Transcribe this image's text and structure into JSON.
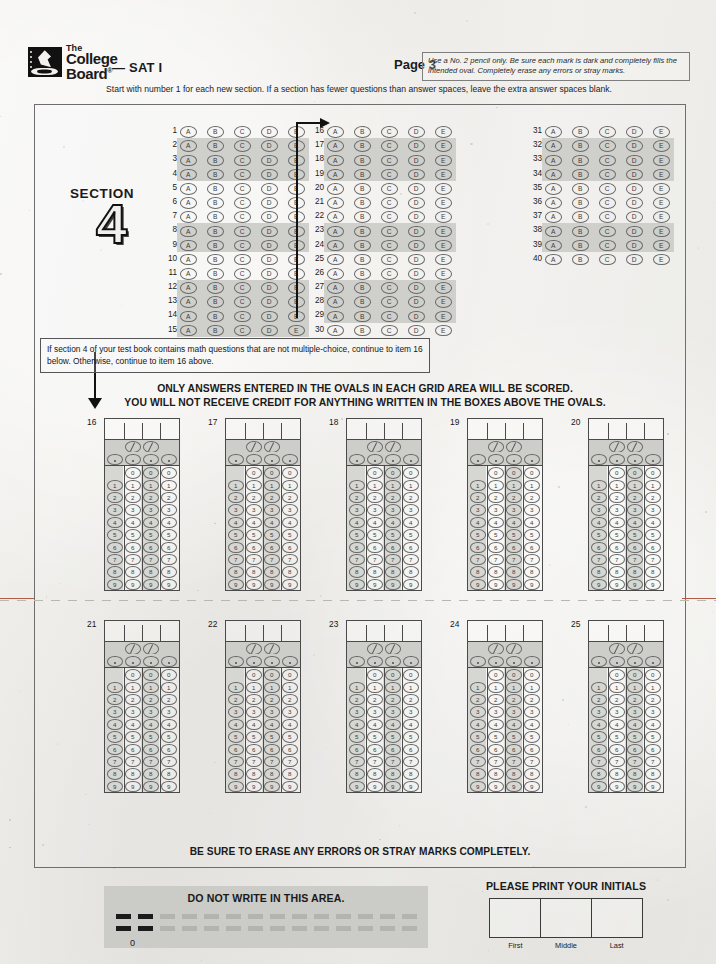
{
  "header": {
    "logo_line1": "The",
    "logo_line2": "College",
    "logo_line3": "Board",
    "logo_sup": "®",
    "brand_suffix": "— SAT I",
    "page_label": "Page 3",
    "pencil_note": "Use a No. 2 pencil only.  Be sure each mark is dark and completely fills the intended oval.  Completely erase any errors or stray marks."
  },
  "start_line": "Start with number 1 for each new section.  If a section has fewer questions than answer spaces, leave the extra answer spaces blank.",
  "section": {
    "label": "SECTION",
    "number": "4",
    "choices": [
      "A",
      "B",
      "C",
      "D",
      "E"
    ],
    "columns": [
      {
        "start": 1,
        "end": 15,
        "shaded_rows": [
          2,
          3,
          4,
          8,
          9,
          12,
          13,
          14,
          15
        ]
      },
      {
        "start": 16,
        "end": 30,
        "shaded_rows": [
          17,
          18,
          19,
          23,
          24,
          27,
          28,
          29
        ]
      },
      {
        "start": 31,
        "end": 40,
        "shaded_rows": [
          32,
          33,
          34,
          38,
          39
        ]
      }
    ]
  },
  "note_box": "If section 4 of your test book contains math questions that are not multiple-choice, continue to item 16 below.  Otherwise, continue to item 16 above.",
  "banner": {
    "line1": "ONLY ANSWERS ENTERED IN THE OVALS IN EACH GRID AREA WILL BE SCORED.",
    "line2": "YOU WILL NOT RECEIVE CREDIT FOR ANYTHING WRITTEN IN THE BOXES ABOVE THE OVALS."
  },
  "gridins": {
    "row1": [
      "16",
      "17",
      "18",
      "19",
      "20"
    ],
    "row2": [
      "21",
      "22",
      "23",
      "24",
      "25"
    ],
    "columns_per_item": 4,
    "fraction_glyph": "/",
    "decimal_glyph": ".",
    "digits": [
      "0",
      "1",
      "2",
      "3",
      "4",
      "5",
      "6",
      "7",
      "8",
      "9"
    ],
    "fraction_columns": [
      1,
      2
    ],
    "decimal_columns": [
      0,
      1,
      2,
      3
    ],
    "zero_omitted_column": 0
  },
  "erase_note": "BE SURE TO ERASE ANY ERRORS OR STRAY MARKS COMPLETELY.",
  "footer": {
    "do_not_write": "DO NOT WRITE IN THIS AREA.",
    "barcode_zero": "0",
    "initials_title": "PLEASE PRINT YOUR INITIALS",
    "initials_labels": [
      "First",
      "Middle",
      "Last"
    ]
  },
  "colors": {
    "paper": "#efefec",
    "shade_band": "#cfcfcb",
    "grid_shade": "#cdcdc9",
    "ink": "#1a1a1a",
    "rule": "#4a4a4a",
    "dnw_panel": "#cbcbc7",
    "fold_mark": "#b05a48"
  }
}
